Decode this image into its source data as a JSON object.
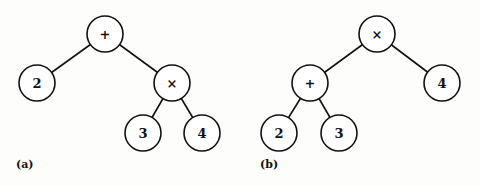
{
  "diagrams": [
    {
      "caption": "(a)",
      "nodes": [
        {
          "id": "root",
          "label": "+",
          "x": 105,
          "y": 34
        },
        {
          "id": "n2",
          "label": "2",
          "x": 37,
          "y": 83
        },
        {
          "id": "mul",
          "label": "×",
          "x": 172,
          "y": 83
        },
        {
          "id": "n3",
          "label": "3",
          "x": 143,
          "y": 133
        },
        {
          "id": "n4",
          "label": "4",
          "x": 202,
          "y": 133
        }
      ],
      "edges": [
        [
          "root",
          "n2"
        ],
        [
          "root",
          "mul"
        ],
        [
          "mul",
          "n3"
        ],
        [
          "mul",
          "n4"
        ]
      ]
    },
    {
      "caption": "(b)",
      "nodes": [
        {
          "id": "root",
          "label": "×",
          "x": 377,
          "y": 34
        },
        {
          "id": "add",
          "label": "+",
          "x": 310,
          "y": 83
        },
        {
          "id": "n4",
          "label": "4",
          "x": 442,
          "y": 83
        },
        {
          "id": "n2",
          "label": "2",
          "x": 279,
          "y": 133
        },
        {
          "id": "n3",
          "label": "3",
          "x": 339,
          "y": 133
        }
      ],
      "edges": [
        [
          "root",
          "add"
        ],
        [
          "root",
          "n4"
        ],
        [
          "add",
          "n2"
        ],
        [
          "add",
          "n3"
        ]
      ]
    }
  ],
  "node_radius": 18
}
